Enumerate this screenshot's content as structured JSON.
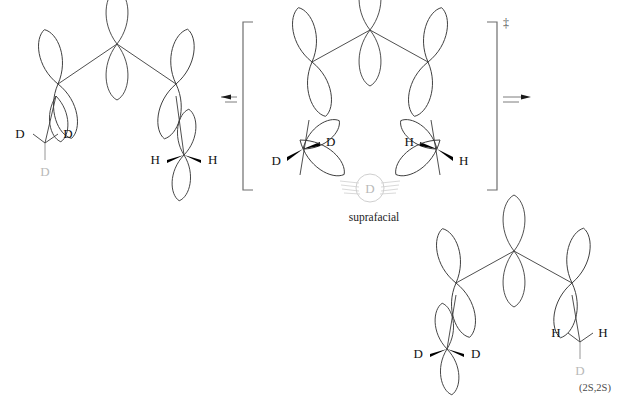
{
  "figure": {
    "kind": "reaction-scheme",
    "caption_transition_state": "suprafacial",
    "transition_state_marker": "‡",
    "product_stereochemistry": "(2S,2S)"
  },
  "colors": {
    "ink": "#3b3b3b",
    "label": "#111111",
    "ghost": "#b9b9b9",
    "bracket": "#6e6e6e",
    "hatch": "#cfcfcf"
  },
  "structures": {
    "reactant": {
      "name": "reactant",
      "left_group_labels": [
        "D",
        "D"
      ],
      "left_group_ghost_label": "D",
      "right_group_labels": [
        "H",
        "H"
      ]
    },
    "transition_state": {
      "name": "transition-state",
      "left_labels": [
        "D",
        "D"
      ],
      "right_labels": [
        "H",
        "H"
      ],
      "migrating_atom": "D",
      "caption": "suprafacial",
      "marker": "‡"
    },
    "product": {
      "name": "product",
      "left_labels": [
        "D",
        "D"
      ],
      "right_group_labels": [
        "H",
        "H"
      ],
      "right_group_ghost_label": "D",
      "stereo_descriptor": "(2S,2S)"
    }
  },
  "arrows": {
    "left": {
      "name": "reverse-arrow",
      "direction": "left"
    },
    "right": {
      "name": "forward-arrow",
      "direction": "right"
    }
  }
}
